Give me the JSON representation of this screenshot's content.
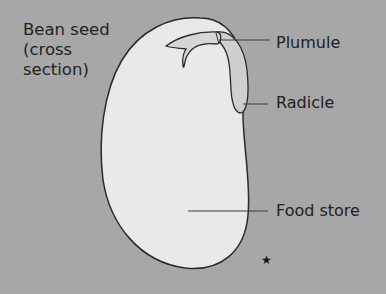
{
  "title": {
    "line1": "Bean seed",
    "line2": "(cross",
    "line3": "section)"
  },
  "labels": {
    "plumule": "Plumule",
    "radicle": "Radicle",
    "food_store": "Food store"
  },
  "marker": "★",
  "colors": {
    "background": "#a7a7a7",
    "seed_fill": "#e9e9e9",
    "outline": "#2a2a2a",
    "leader_line": "#3a3a3a",
    "radicle_fill": "#c9c9c9"
  }
}
